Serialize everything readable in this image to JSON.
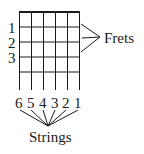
{
  "diagram": {
    "type": "guitar-chord-chart-legend",
    "fret_labels": [
      "1",
      "2",
      "3"
    ],
    "frets_label": "Frets",
    "string_labels": [
      "6",
      "5",
      "4",
      "3",
      "2",
      "1"
    ],
    "strings_label": "Strings",
    "grid": {
      "strings": 6,
      "fret_rows": 5
    },
    "colors": {
      "ink": "#1a1a1a",
      "background": "#ffffff"
    }
  }
}
